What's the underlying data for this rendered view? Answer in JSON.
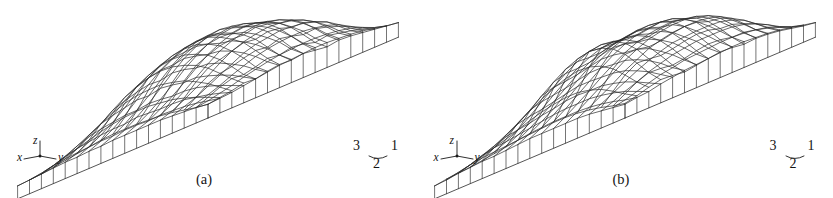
{
  "figure": {
    "background_color": "#ffffff",
    "line_color": "#2a2a2a",
    "panel_count": 2
  },
  "panels": [
    {
      "id": "panel-a",
      "caption": "(a)",
      "axes": {
        "x_label": "x",
        "y_label": "y",
        "z_label": "z"
      },
      "corner_labels": {
        "left": "3",
        "middle": "2",
        "right": "1"
      }
    },
    {
      "id": "panel-b",
      "caption": "(b)",
      "axes": {
        "x_label": "x",
        "y_label": "y",
        "z_label": "z"
      },
      "corner_labels": {
        "left": "3",
        "middle": "2",
        "right": "1"
      }
    }
  ],
  "chart_data": [
    {
      "type": "surface",
      "title": "(a)",
      "projection": "isometric-wireframe",
      "xlabel": "x",
      "ylabel": "y",
      "zlabel": "z",
      "grid": true,
      "legend": "none",
      "grid_size": {
        "nx": 17,
        "ny": 17
      },
      "xlim": [
        0,
        16
      ],
      "ylim": [
        0,
        16
      ],
      "zlim": [
        0,
        1
      ],
      "annotations": [
        "3",
        "2",
        "1"
      ],
      "seed": 17,
      "description": "Rough stochastic terrain surface with skirt walls dropping to a flat base plane; mesh drawn as a diamond grid in isometric view.",
      "z_values": [
        [
          0.16,
          0.18,
          0.2,
          0.23,
          0.22,
          0.25,
          0.27,
          0.26,
          0.28,
          0.26,
          0.24,
          0.26,
          0.25,
          0.23,
          0.21,
          0.19,
          0.17
        ],
        [
          0.18,
          0.24,
          0.3,
          0.34,
          0.33,
          0.36,
          0.4,
          0.38,
          0.41,
          0.39,
          0.35,
          0.37,
          0.34,
          0.31,
          0.27,
          0.23,
          0.19
        ],
        [
          0.21,
          0.3,
          0.4,
          0.46,
          0.48,
          0.52,
          0.55,
          0.53,
          0.57,
          0.54,
          0.5,
          0.51,
          0.47,
          0.42,
          0.36,
          0.29,
          0.22
        ],
        [
          0.24,
          0.35,
          0.48,
          0.58,
          0.62,
          0.66,
          0.7,
          0.68,
          0.71,
          0.69,
          0.64,
          0.64,
          0.59,
          0.53,
          0.44,
          0.34,
          0.25
        ],
        [
          0.26,
          0.39,
          0.55,
          0.67,
          0.73,
          0.78,
          0.8,
          0.79,
          0.82,
          0.8,
          0.75,
          0.73,
          0.67,
          0.59,
          0.49,
          0.37,
          0.27
        ],
        [
          0.27,
          0.41,
          0.59,
          0.73,
          0.8,
          0.86,
          0.88,
          0.87,
          0.89,
          0.87,
          0.82,
          0.79,
          0.72,
          0.63,
          0.52,
          0.39,
          0.28
        ],
        [
          0.28,
          0.43,
          0.62,
          0.77,
          0.85,
          0.91,
          0.94,
          0.93,
          0.95,
          0.92,
          0.87,
          0.83,
          0.75,
          0.65,
          0.54,
          0.4,
          0.29
        ],
        [
          0.28,
          0.43,
          0.62,
          0.78,
          0.86,
          0.92,
          0.95,
          0.96,
          0.97,
          0.93,
          0.88,
          0.84,
          0.76,
          0.66,
          0.54,
          0.4,
          0.29
        ],
        [
          0.28,
          0.42,
          0.61,
          0.76,
          0.84,
          0.9,
          0.93,
          0.94,
          0.95,
          0.91,
          0.86,
          0.82,
          0.74,
          0.64,
          0.53,
          0.39,
          0.28
        ],
        [
          0.27,
          0.4,
          0.58,
          0.72,
          0.79,
          0.85,
          0.87,
          0.88,
          0.89,
          0.86,
          0.81,
          0.78,
          0.71,
          0.62,
          0.51,
          0.38,
          0.27
        ],
        [
          0.25,
          0.37,
          0.53,
          0.65,
          0.71,
          0.76,
          0.79,
          0.79,
          0.81,
          0.78,
          0.74,
          0.72,
          0.66,
          0.58,
          0.48,
          0.36,
          0.26
        ],
        [
          0.23,
          0.33,
          0.46,
          0.56,
          0.61,
          0.65,
          0.68,
          0.67,
          0.7,
          0.68,
          0.64,
          0.63,
          0.58,
          0.51,
          0.43,
          0.33,
          0.24
        ],
        [
          0.21,
          0.29,
          0.39,
          0.46,
          0.5,
          0.53,
          0.56,
          0.55,
          0.58,
          0.56,
          0.53,
          0.53,
          0.49,
          0.44,
          0.38,
          0.3,
          0.22
        ],
        [
          0.19,
          0.25,
          0.32,
          0.37,
          0.4,
          0.42,
          0.44,
          0.44,
          0.46,
          0.45,
          0.43,
          0.43,
          0.41,
          0.37,
          0.32,
          0.26,
          0.2
        ],
        [
          0.17,
          0.21,
          0.26,
          0.29,
          0.31,
          0.33,
          0.34,
          0.34,
          0.36,
          0.35,
          0.34,
          0.34,
          0.33,
          0.3,
          0.27,
          0.23,
          0.18
        ],
        [
          0.16,
          0.18,
          0.21,
          0.23,
          0.24,
          0.25,
          0.26,
          0.26,
          0.27,
          0.27,
          0.26,
          0.27,
          0.26,
          0.25,
          0.23,
          0.2,
          0.17
        ],
        [
          0.15,
          0.16,
          0.17,
          0.18,
          0.19,
          0.19,
          0.2,
          0.2,
          0.21,
          0.21,
          0.21,
          0.21,
          0.21,
          0.2,
          0.19,
          0.18,
          0.16
        ]
      ]
    },
    {
      "type": "surface",
      "title": "(b)",
      "projection": "isometric-wireframe",
      "xlabel": "x",
      "ylabel": "y",
      "zlabel": "z",
      "grid": true,
      "legend": "none",
      "grid_size": {
        "nx": 17,
        "ny": 17
      },
      "xlim": [
        0,
        16
      ],
      "ylim": [
        0,
        16
      ],
      "zlim": [
        0,
        1
      ],
      "annotations": [
        "3",
        "2",
        "1"
      ],
      "seed": 43,
      "description": "Second rough stochastic terrain surface, similar statistics to (a) but a different realization; taller ridge toward the rear-left.",
      "z_values": [
        [
          0.17,
          0.2,
          0.24,
          0.27,
          0.26,
          0.24,
          0.26,
          0.28,
          0.3,
          0.29,
          0.27,
          0.28,
          0.27,
          0.25,
          0.22,
          0.19,
          0.17
        ],
        [
          0.2,
          0.28,
          0.36,
          0.41,
          0.4,
          0.38,
          0.4,
          0.43,
          0.45,
          0.44,
          0.41,
          0.41,
          0.38,
          0.34,
          0.29,
          0.24,
          0.2
        ],
        [
          0.24,
          0.37,
          0.5,
          0.58,
          0.57,
          0.55,
          0.57,
          0.6,
          0.62,
          0.61,
          0.57,
          0.56,
          0.51,
          0.45,
          0.38,
          0.3,
          0.23
        ],
        [
          0.27,
          0.45,
          0.63,
          0.74,
          0.74,
          0.71,
          0.72,
          0.75,
          0.77,
          0.76,
          0.71,
          0.69,
          0.63,
          0.55,
          0.45,
          0.35,
          0.26
        ],
        [
          0.29,
          0.5,
          0.72,
          0.86,
          0.87,
          0.83,
          0.83,
          0.86,
          0.88,
          0.86,
          0.81,
          0.78,
          0.71,
          0.61,
          0.5,
          0.38,
          0.28
        ],
        [
          0.3,
          0.53,
          0.77,
          0.93,
          0.95,
          0.91,
          0.9,
          0.92,
          0.94,
          0.92,
          0.86,
          0.83,
          0.75,
          0.65,
          0.53,
          0.4,
          0.29
        ],
        [
          0.3,
          0.53,
          0.78,
          0.95,
          0.97,
          0.94,
          0.93,
          0.95,
          0.96,
          0.94,
          0.89,
          0.85,
          0.77,
          0.66,
          0.54,
          0.41,
          0.3
        ],
        [
          0.29,
          0.51,
          0.75,
          0.92,
          0.95,
          0.93,
          0.92,
          0.94,
          0.96,
          0.93,
          0.88,
          0.85,
          0.77,
          0.66,
          0.54,
          0.41,
          0.3
        ],
        [
          0.28,
          0.48,
          0.7,
          0.86,
          0.89,
          0.88,
          0.88,
          0.91,
          0.93,
          0.91,
          0.86,
          0.83,
          0.76,
          0.65,
          0.54,
          0.4,
          0.29
        ],
        [
          0.27,
          0.44,
          0.63,
          0.77,
          0.81,
          0.81,
          0.82,
          0.85,
          0.88,
          0.86,
          0.82,
          0.8,
          0.73,
          0.64,
          0.52,
          0.39,
          0.28
        ],
        [
          0.25,
          0.39,
          0.55,
          0.67,
          0.71,
          0.72,
          0.74,
          0.77,
          0.8,
          0.79,
          0.76,
          0.74,
          0.69,
          0.6,
          0.5,
          0.38,
          0.27
        ],
        [
          0.23,
          0.34,
          0.47,
          0.56,
          0.6,
          0.62,
          0.64,
          0.67,
          0.7,
          0.7,
          0.68,
          0.67,
          0.62,
          0.55,
          0.46,
          0.35,
          0.26
        ],
        [
          0.21,
          0.3,
          0.39,
          0.46,
          0.49,
          0.51,
          0.54,
          0.57,
          0.6,
          0.6,
          0.59,
          0.58,
          0.55,
          0.49,
          0.42,
          0.33,
          0.24
        ],
        [
          0.19,
          0.26,
          0.32,
          0.37,
          0.39,
          0.41,
          0.44,
          0.46,
          0.49,
          0.5,
          0.49,
          0.49,
          0.46,
          0.42,
          0.36,
          0.29,
          0.22
        ],
        [
          0.18,
          0.22,
          0.27,
          0.3,
          0.31,
          0.33,
          0.35,
          0.37,
          0.39,
          0.4,
          0.4,
          0.4,
          0.38,
          0.35,
          0.31,
          0.25,
          0.19
        ],
        [
          0.16,
          0.19,
          0.22,
          0.24,
          0.25,
          0.26,
          0.27,
          0.29,
          0.3,
          0.31,
          0.31,
          0.31,
          0.3,
          0.28,
          0.25,
          0.21,
          0.18
        ],
        [
          0.15,
          0.17,
          0.18,
          0.19,
          0.2,
          0.2,
          0.21,
          0.22,
          0.23,
          0.23,
          0.23,
          0.23,
          0.23,
          0.22,
          0.2,
          0.18,
          0.16
        ]
      ]
    }
  ]
}
